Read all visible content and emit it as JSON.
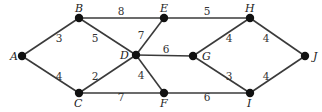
{
  "diagram": {
    "type": "weighted-undirected-graph",
    "nodes": [
      {
        "id": "A",
        "x": 22,
        "y": 56,
        "lx": 10,
        "ly": 60
      },
      {
        "id": "B",
        "x": 79,
        "y": 18,
        "lx": 75,
        "ly": 12
      },
      {
        "id": "C",
        "x": 79,
        "y": 93,
        "lx": 74,
        "ly": 107
      },
      {
        "id": "D",
        "x": 136,
        "y": 55,
        "lx": 120,
        "ly": 59
      },
      {
        "id": "E",
        "x": 164,
        "y": 18,
        "lx": 160,
        "ly": 12
      },
      {
        "id": "F",
        "x": 164,
        "y": 93,
        "lx": 160,
        "ly": 107
      },
      {
        "id": "G",
        "x": 193,
        "y": 56,
        "lx": 202,
        "ly": 60
      },
      {
        "id": "H",
        "x": 250,
        "y": 18,
        "lx": 245,
        "ly": 12
      },
      {
        "id": "I",
        "x": 250,
        "y": 93,
        "lx": 247,
        "ly": 107
      },
      {
        "id": "J",
        "x": 305,
        "y": 56,
        "lx": 313,
        "ly": 60
      }
    ],
    "edges": [
      {
        "from": "A",
        "to": "B",
        "weight": "3",
        "wx": 59,
        "wy": 42
      },
      {
        "from": "A",
        "to": "C",
        "weight": "4",
        "wx": 59,
        "wy": 80
      },
      {
        "from": "B",
        "to": "E",
        "weight": "8",
        "wx": 121,
        "wy": 15
      },
      {
        "from": "B",
        "to": "D",
        "weight": "5",
        "wx": 95,
        "wy": 42
      },
      {
        "from": "C",
        "to": "D",
        "weight": "2",
        "wx": 95,
        "wy": 80
      },
      {
        "from": "C",
        "to": "F",
        "weight": "7",
        "wx": 121,
        "wy": 101
      },
      {
        "from": "D",
        "to": "E",
        "weight": "7",
        "wx": 141,
        "wy": 39
      },
      {
        "from": "D",
        "to": "G",
        "weight": "6",
        "wx": 166,
        "wy": 53
      },
      {
        "from": "D",
        "to": "F",
        "weight": "4",
        "wx": 141,
        "wy": 79
      },
      {
        "from": "E",
        "to": "H",
        "weight": "5",
        "wx": 207,
        "wy": 15
      },
      {
        "from": "F",
        "to": "I",
        "weight": "6",
        "wx": 207,
        "wy": 101
      },
      {
        "from": "G",
        "to": "H",
        "weight": "4",
        "wx": 229,
        "wy": 42
      },
      {
        "from": "G",
        "to": "I",
        "weight": "3",
        "wx": 229,
        "wy": 80
      },
      {
        "from": "H",
        "to": "J",
        "weight": "4",
        "wx": 266,
        "wy": 42
      },
      {
        "from": "I",
        "to": "J",
        "weight": "4",
        "wx": 266,
        "wy": 80
      }
    ]
  }
}
